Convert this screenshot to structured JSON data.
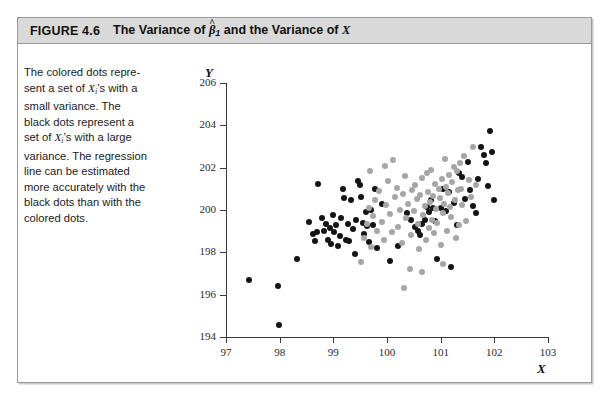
{
  "figure": {
    "label": "FIGURE 4.6",
    "title_prefix": "The Variance of ",
    "title_beta": "β",
    "title_beta_hat": "^",
    "title_beta_sub": "1",
    "title_middle": " and the Variance of ",
    "title_x": "X"
  },
  "caption": {
    "line1": "The colored dots repre-",
    "line2_a": "sent a set of ",
    "line2_x": "X",
    "line2_sub": "i",
    "line2_b": "’s with a",
    "line3": "small variance. The",
    "line4": "black dots represent a",
    "line5_a": "set of ",
    "line5_x": "X",
    "line5_sub": "i",
    "line5_b": "’s with a large",
    "line6": "variance. The regression",
    "line7": "line can be estimated",
    "line8": "more accurately with the",
    "line9": "black dots than with the",
    "line10": "colored dots."
  },
  "chart_data": {
    "type": "scatter",
    "xlabel": "X",
    "ylabel": "Y",
    "xlim": [
      97,
      103
    ],
    "ylim": [
      194,
      206
    ],
    "xticks": [
      97,
      98,
      99,
      100,
      101,
      102,
      103
    ],
    "yticks": [
      194,
      196,
      198,
      200,
      202,
      204,
      206
    ],
    "grid": false,
    "legend": null,
    "colors": {
      "black_series": "#141414",
      "colored_series": "#a6a6a6"
    },
    "series": [
      {
        "name": "black dots (large variance of X)",
        "color": "#141414",
        "points": [
          [
            97.42,
            196.7
          ],
          [
            97.97,
            196.4
          ],
          [
            97.99,
            194.55
          ],
          [
            98.32,
            197.7
          ],
          [
            98.55,
            199.45
          ],
          [
            98.62,
            198.85
          ],
          [
            98.66,
            198.55
          ],
          [
            98.69,
            198.95
          ],
          [
            98.72,
            201.25
          ],
          [
            98.78,
            199.6
          ],
          [
            98.83,
            199.0
          ],
          [
            98.86,
            199.35
          ],
          [
            98.9,
            198.6
          ],
          [
            98.93,
            199.15
          ],
          [
            98.96,
            198.4
          ],
          [
            99.0,
            199.75
          ],
          [
            99.02,
            198.95
          ],
          [
            99.05,
            199.3
          ],
          [
            99.08,
            198.3
          ],
          [
            99.12,
            198.75
          ],
          [
            99.15,
            199.6
          ],
          [
            99.18,
            201.0
          ],
          [
            99.2,
            200.55
          ],
          [
            99.24,
            198.6
          ],
          [
            99.27,
            199.35
          ],
          [
            99.3,
            198.55
          ],
          [
            99.33,
            200.45
          ],
          [
            99.36,
            199.1
          ],
          [
            99.4,
            197.9
          ],
          [
            99.43,
            199.55
          ],
          [
            99.46,
            201.35
          ],
          [
            99.5,
            201.2
          ],
          [
            99.52,
            200.6
          ],
          [
            99.55,
            199.4
          ],
          [
            99.58,
            198.85
          ],
          [
            99.6,
            199.9
          ],
          [
            99.63,
            199.25
          ],
          [
            99.66,
            198.5
          ],
          [
            99.7,
            200.0
          ],
          [
            99.74,
            199.3
          ],
          [
            99.78,
            201.0
          ],
          [
            99.82,
            198.2
          ],
          [
            99.9,
            200.3
          ],
          [
            100.05,
            197.6
          ],
          [
            100.2,
            198.3
          ],
          [
            100.38,
            199.85
          ],
          [
            100.45,
            199.55
          ],
          [
            100.52,
            199.2
          ],
          [
            100.58,
            199.0
          ],
          [
            100.62,
            198.8
          ],
          [
            100.66,
            199.35
          ],
          [
            100.7,
            199.55
          ],
          [
            100.74,
            200.15
          ],
          [
            100.78,
            199.9
          ],
          [
            100.82,
            200.45
          ],
          [
            100.86,
            200.1
          ],
          [
            100.9,
            199.5
          ],
          [
            100.94,
            197.7
          ],
          [
            101.0,
            200.1
          ],
          [
            101.05,
            201.0
          ],
          [
            101.1,
            199.95
          ],
          [
            101.15,
            200.85
          ],
          [
            101.2,
            197.3
          ],
          [
            101.25,
            200.35
          ],
          [
            101.3,
            199.3
          ],
          [
            101.35,
            201.75
          ],
          [
            101.4,
            201.55
          ],
          [
            101.45,
            200.5
          ],
          [
            101.5,
            202.25
          ],
          [
            101.55,
            200.95
          ],
          [
            101.6,
            200.2
          ],
          [
            101.65,
            199.85
          ],
          [
            101.7,
            201.45
          ],
          [
            101.75,
            203.0
          ],
          [
            101.8,
            202.6
          ],
          [
            101.85,
            202.2
          ],
          [
            101.88,
            201.15
          ],
          [
            101.92,
            203.75
          ],
          [
            101.95,
            202.75
          ],
          [
            102.0,
            200.45
          ]
        ]
      },
      {
        "name": "colored dots (small variance of X)",
        "color": "#a6a6a6",
        "points": [
          [
            99.52,
            197.55
          ],
          [
            99.58,
            198.7
          ],
          [
            99.62,
            199.35
          ],
          [
            99.66,
            200.1
          ],
          [
            99.7,
            198.25
          ],
          [
            99.74,
            199.7
          ],
          [
            99.78,
            200.45
          ],
          [
            99.82,
            199.0
          ],
          [
            99.86,
            200.9
          ],
          [
            99.9,
            199.45
          ],
          [
            99.94,
            198.6
          ],
          [
            99.98,
            200.25
          ],
          [
            100.02,
            201.35
          ],
          [
            100.06,
            199.8
          ],
          [
            100.1,
            198.95
          ],
          [
            100.14,
            200.6
          ],
          [
            100.18,
            201.05
          ],
          [
            100.2,
            199.2
          ],
          [
            100.24,
            200.0
          ],
          [
            100.28,
            198.45
          ],
          [
            100.3,
            200.75
          ],
          [
            100.34,
            201.6
          ],
          [
            100.36,
            199.6
          ],
          [
            100.4,
            200.3
          ],
          [
            100.44,
            198.8
          ],
          [
            100.46,
            200.95
          ],
          [
            100.5,
            199.95
          ],
          [
            100.52,
            201.2
          ],
          [
            100.55,
            200.5
          ],
          [
            100.58,
            199.35
          ],
          [
            100.6,
            198.15
          ],
          [
            100.62,
            200.7
          ],
          [
            100.65,
            201.5
          ],
          [
            100.68,
            199.75
          ],
          [
            100.7,
            200.2
          ],
          [
            100.72,
            198.6
          ],
          [
            100.74,
            201.75
          ],
          [
            100.76,
            200.85
          ],
          [
            100.78,
            199.15
          ],
          [
            100.8,
            200.4
          ],
          [
            100.82,
            201.9
          ],
          [
            100.84,
            199.55
          ],
          [
            100.86,
            200.65
          ],
          [
            100.88,
            198.9
          ],
          [
            100.9,
            201.25
          ],
          [
            100.92,
            200.05
          ],
          [
            100.94,
            199.4
          ],
          [
            100.96,
            201.0
          ],
          [
            100.98,
            200.55
          ],
          [
            101.0,
            198.35
          ],
          [
            101.02,
            201.45
          ],
          [
            101.04,
            199.85
          ],
          [
            101.06,
            200.3
          ],
          [
            101.08,
            202.4
          ],
          [
            101.1,
            201.1
          ],
          [
            101.12,
            199.0
          ],
          [
            101.14,
            200.8
          ],
          [
            101.16,
            201.65
          ],
          [
            101.18,
            200.15
          ],
          [
            101.2,
            199.65
          ],
          [
            101.22,
            201.3
          ],
          [
            101.24,
            202.05
          ],
          [
            101.26,
            200.45
          ],
          [
            101.28,
            198.7
          ],
          [
            101.3,
            201.85
          ],
          [
            101.32,
            200.95
          ],
          [
            101.34,
            199.3
          ],
          [
            101.36,
            202.2
          ],
          [
            101.38,
            201.0
          ],
          [
            101.4,
            200.25
          ],
          [
            101.44,
            202.55
          ],
          [
            101.48,
            199.5
          ],
          [
            101.52,
            201.4
          ],
          [
            101.56,
            200.6
          ],
          [
            101.6,
            203.0
          ],
          [
            101.65,
            201.2
          ],
          [
            100.32,
            196.3
          ],
          [
            100.42,
            197.2
          ],
          [
            100.66,
            197.05
          ],
          [
            101.05,
            197.45
          ],
          [
            99.68,
            201.85
          ],
          [
            99.96,
            202.1
          ],
          [
            100.12,
            202.35
          ]
        ]
      }
    ]
  }
}
